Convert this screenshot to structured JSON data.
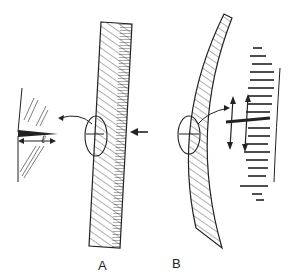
{
  "figure": {
    "panels": [
      {
        "id": "A",
        "label": "A",
        "description": "Straight hatched beam; compression arrow from right; circled detail with crack of width l shown at left"
      },
      {
        "id": "B",
        "label": "B",
        "description": "Curved (bent) hatched beam; circled detail with stretched fibers and vertical double arrows shown at right"
      }
    ],
    "detail_A_dimension": "ℓ",
    "colors": {
      "ink": "#222222",
      "background": "#ffffff"
    }
  }
}
